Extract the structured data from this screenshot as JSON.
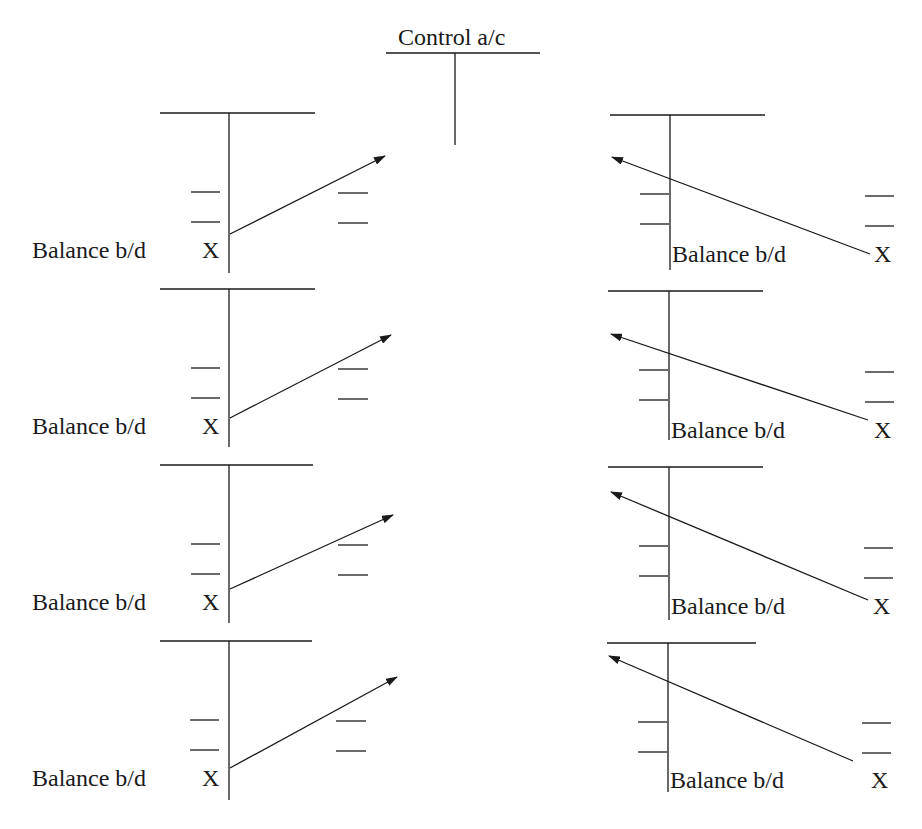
{
  "diagram": {
    "title": "Control a/c",
    "ink_color": "#1a1a1a",
    "left_accounts": [
      {
        "label": "Balance b/d",
        "value": "X"
      },
      {
        "label": "Balance b/d",
        "value": "X"
      },
      {
        "label": "Balance b/d",
        "value": "X"
      },
      {
        "label": "Balance b/d",
        "value": "X"
      }
    ],
    "right_accounts": [
      {
        "label": "Balance b/d",
        "value": "X"
      },
      {
        "label": "Balance b/d",
        "value": "X"
      },
      {
        "label": "Balance b/d",
        "value": "X"
      },
      {
        "label": "Balance b/d",
        "value": "X"
      }
    ]
  }
}
